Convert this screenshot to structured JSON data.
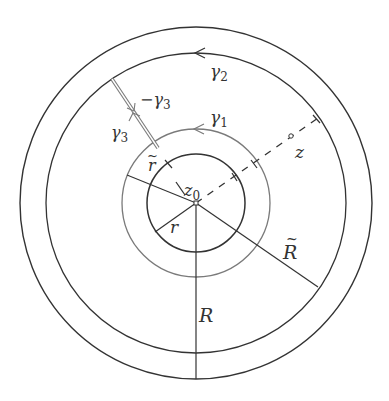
{
  "figure": {
    "center": {
      "x": 196,
      "y": 203
    },
    "colors": {
      "dark": "#333333",
      "gray": "#7a7a7a",
      "background": "#ffffff"
    },
    "circles": {
      "inner_r": {
        "radius": 49,
        "label": "r"
      },
      "gamma1": {
        "radius": 74,
        "label": "γ1",
        "tilde_label": "r̃"
      },
      "gamma2": {
        "radius": 150,
        "label": "γ2",
        "tilde_label": "R̃"
      },
      "outer_R": {
        "radius": 176,
        "label": "R"
      }
    },
    "labels": {
      "gamma1": "γ",
      "gamma1_sub": "1",
      "gamma2": "γ",
      "gamma2_sub": "2",
      "gamma3": "γ",
      "gamma3_sub": "3",
      "minus_gamma3": "−γ",
      "minus_gamma3_sub": "3",
      "z0": "z",
      "z0_sub": "0",
      "z": "z",
      "r": "r",
      "r_tilde": "r",
      "R": "R",
      "R_tilde": "R",
      "tilde": "~"
    }
  }
}
